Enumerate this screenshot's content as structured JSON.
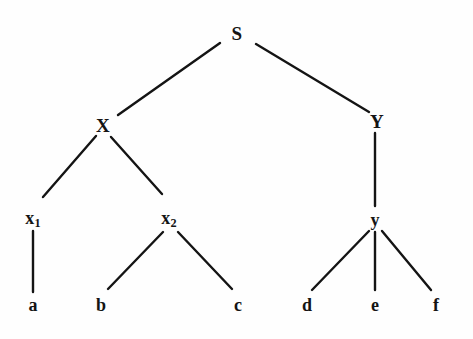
{
  "figure": {
    "kind": "syntax-tree-diagram",
    "background_color": "#fefefe",
    "ink_color": "#141414",
    "width": 473,
    "height": 339
  },
  "nodes": [
    {
      "id": "S",
      "label": "S",
      "base": "S",
      "subscript": "",
      "x": 237,
      "y": 33,
      "level": 0,
      "style": "cap"
    },
    {
      "id": "X",
      "label": "X",
      "base": "X",
      "subscript": "",
      "x": 103,
      "y": 125,
      "level": 1,
      "style": "cap"
    },
    {
      "id": "Y",
      "label": "Y",
      "base": "Y",
      "subscript": "",
      "x": 377,
      "y": 121,
      "level": 1,
      "style": "cap"
    },
    {
      "id": "x1",
      "label": "x1",
      "base": "x",
      "subscript": "1",
      "x": 33,
      "y": 219,
      "level": 2,
      "style": "sub-host"
    },
    {
      "id": "x2",
      "label": "x2",
      "base": "x",
      "subscript": "2",
      "x": 169,
      "y": 219,
      "level": 2,
      "style": "sub-host"
    },
    {
      "id": "y",
      "label": "y",
      "base": "y",
      "subscript": "",
      "x": 375,
      "y": 220,
      "level": 2,
      "style": "lower"
    },
    {
      "id": "a",
      "label": "a",
      "base": "a",
      "subscript": "",
      "x": 33,
      "y": 305,
      "level": 3,
      "style": "lower"
    },
    {
      "id": "b",
      "label": "b",
      "base": "b",
      "subscript": "",
      "x": 101,
      "y": 305,
      "level": 3,
      "style": "lower"
    },
    {
      "id": "c",
      "label": "c",
      "base": "c",
      "subscript": "",
      "x": 238,
      "y": 305,
      "level": 3,
      "style": "lower"
    },
    {
      "id": "d",
      "label": "d",
      "base": "d",
      "subscript": "",
      "x": 307,
      "y": 305,
      "level": 3,
      "style": "lower"
    },
    {
      "id": "e",
      "label": "e",
      "base": "e",
      "subscript": "",
      "x": 375,
      "y": 305,
      "level": 3,
      "style": "lower"
    },
    {
      "id": "f",
      "label": "f",
      "base": "f",
      "subscript": "",
      "x": 436,
      "y": 305,
      "level": 3,
      "style": "lower"
    }
  ],
  "edges": [
    {
      "id": "S-X",
      "from": "S",
      "to": "X",
      "x1": 220,
      "y1": 43,
      "x2": 118,
      "y2": 115
    },
    {
      "id": "S-Y",
      "from": "S",
      "to": "Y",
      "x1": 256,
      "y1": 44,
      "x2": 369,
      "y2": 112
    },
    {
      "id": "X-x1",
      "from": "X",
      "to": "x1",
      "x1": 96,
      "y1": 136,
      "x2": 43,
      "y2": 197
    },
    {
      "id": "X-x2",
      "from": "X",
      "to": "x2",
      "x1": 111,
      "y1": 137,
      "x2": 162,
      "y2": 194
    },
    {
      "id": "Y-y",
      "from": "Y",
      "to": "y",
      "x1": 375,
      "y1": 133,
      "x2": 375,
      "y2": 206
    },
    {
      "id": "x1-a",
      "from": "x1",
      "to": "a",
      "x1": 33,
      "y1": 231,
      "x2": 33,
      "y2": 292
    },
    {
      "id": "x2-b",
      "from": "x2",
      "to": "b",
      "x1": 163,
      "y1": 232,
      "x2": 108,
      "y2": 289
    },
    {
      "id": "x2-c",
      "from": "x2",
      "to": "c",
      "x1": 178,
      "y1": 232,
      "x2": 232,
      "y2": 289
    },
    {
      "id": "y-d",
      "from": "y",
      "to": "d",
      "x1": 369,
      "y1": 231,
      "x2": 312,
      "y2": 290
    },
    {
      "id": "y-e",
      "from": "y",
      "to": "e",
      "x1": 375,
      "y1": 232,
      "x2": 375,
      "y2": 290
    },
    {
      "id": "y-f",
      "from": "y",
      "to": "f",
      "x1": 382,
      "y1": 231,
      "x2": 431,
      "y2": 290
    }
  ]
}
